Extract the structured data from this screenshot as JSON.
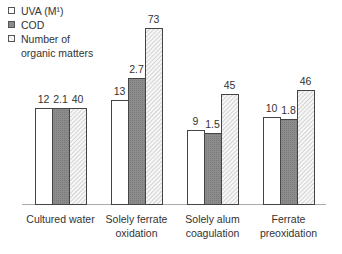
{
  "chart_data": {
    "type": "bar",
    "title": "",
    "xlabel": "",
    "ylabel": "",
    "grid": false,
    "legend_position": "top-left",
    "categories": [
      "Cultured water",
      "Solely ferrate oxidation",
      "Solely alum coagulation",
      "Ferrate preoxidation"
    ],
    "category_lines": [
      [
        "Cultured water"
      ],
      [
        "Solely ferrate",
        "oxidation"
      ],
      [
        "Solely alum",
        "coagulation"
      ],
      [
        "Ferrate",
        "preoxidation"
      ]
    ],
    "series": [
      {
        "name": "UVA (M¹)",
        "values": [
          12,
          13,
          9,
          10
        ],
        "labels": [
          "12",
          "13",
          "9",
          "10"
        ],
        "fill": "#ffffff",
        "pattern": "none"
      },
      {
        "name": "COD",
        "values": [
          2.1,
          2.7,
          1.5,
          1.8
        ],
        "labels": [
          "2.1",
          "2.7",
          "1.5",
          "1.8"
        ],
        "fill": "#8a8a8a",
        "pattern": "stipple"
      },
      {
        "name": "Number of organic matters",
        "values": [
          40,
          73,
          45,
          46
        ],
        "labels": [
          "40",
          "73",
          "45",
          "46"
        ],
        "fill": "#f4f4f4",
        "pattern": "diagonal-hatch"
      }
    ],
    "legend": [
      "UVA (M¹)",
      "COD",
      "Number of\norganic matters"
    ],
    "note": "Each series is independently scaled; bar heights are relative."
  },
  "legend_lines": {
    "uva": "UVA (M¹)",
    "cod": "COD",
    "org1": "Number of",
    "org2": "organic matters"
  },
  "geometry": {
    "baseline": 204,
    "bar_width": 17,
    "groups_x": [
      35,
      111,
      187,
      263
    ],
    "tops": [
      [
        108,
        108,
        108
      ],
      [
        100,
        78,
        28
      ],
      [
        130,
        133,
        94
      ],
      [
        117,
        119,
        90
      ]
    ]
  }
}
